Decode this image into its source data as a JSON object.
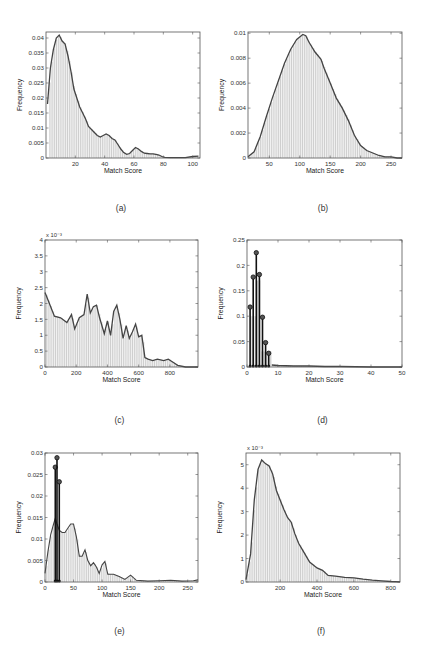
{
  "panels": [
    {
      "id": "a",
      "caption": "(a)",
      "frame": {
        "x": 46,
        "y": 32,
        "w": 154,
        "h": 126
      },
      "xlim": [
        0,
        105
      ],
      "ylim": [
        0,
        0.042
      ],
      "xticks": [
        20,
        40,
        60,
        80,
        100
      ],
      "yticks": [
        0,
        0.005,
        0.01,
        0.015,
        0.02,
        0.025,
        0.03,
        0.035,
        0.04
      ],
      "ytick_labels": [
        "0",
        "0.005",
        "0.01",
        "0.015",
        "0.02",
        "0.025",
        "0.03",
        "0.035",
        "0.04"
      ],
      "exponent": "",
      "xlabel": "Match Score",
      "ylabel": "Frequency",
      "stems": []
    },
    {
      "id": "b",
      "caption": "(b)",
      "frame": {
        "x": 248,
        "y": 32,
        "w": 154,
        "h": 126
      },
      "xlim": [
        15,
        268
      ],
      "ylim": [
        0,
        0.0101
      ],
      "xticks": [
        50,
        100,
        150,
        200,
        250
      ],
      "yticks": [
        0,
        0.002,
        0.004,
        0.006,
        0.008,
        0.01
      ],
      "ytick_labels": [
        "0",
        "0.002",
        "0.004",
        "0.006",
        "0.008",
        "0.01"
      ],
      "exponent": "",
      "xlabel": "Match Score",
      "ylabel": "Frequency",
      "stems": []
    },
    {
      "id": "c",
      "caption": "(c)",
      "frame": {
        "x": 45,
        "y": 240,
        "w": 153,
        "h": 127
      },
      "xlim": [
        0,
        980
      ],
      "ylim": [
        0,
        4
      ],
      "xticks": [
        0,
        200,
        400,
        600,
        800
      ],
      "yticks": [
        0,
        0.5,
        1,
        1.5,
        2,
        2.5,
        3,
        3.5,
        4
      ],
      "ytick_labels": [
        "0",
        "0.5",
        "1",
        "1.5",
        "2",
        "2.5",
        "3",
        "3.5",
        "4"
      ],
      "exponent": "x 10⁻³",
      "xlabel": "Match Score",
      "ylabel": "Frequency",
      "stems": []
    },
    {
      "id": "d",
      "caption": "(d)",
      "frame": {
        "x": 247,
        "y": 240,
        "w": 155,
        "h": 127
      },
      "xlim": [
        0,
        50
      ],
      "ylim": [
        0,
        0.25
      ],
      "xticks": [
        0,
        10,
        20,
        30,
        40,
        50
      ],
      "yticks": [
        0,
        0.05,
        0.1,
        0.15,
        0.2,
        0.25
      ],
      "ytick_labels": [
        "0",
        "0.05",
        "0.1",
        "0.15",
        "0.2",
        "0.25"
      ],
      "exponent": "",
      "xlabel": "Match Score",
      "ylabel": "Frequency",
      "stems": [
        [
          1,
          0.118
        ],
        [
          2,
          0.177
        ],
        [
          3,
          0.225
        ],
        [
          4,
          0.182
        ],
        [
          5,
          0.098
        ],
        [
          6,
          0.048
        ],
        [
          7,
          0.027
        ]
      ]
    },
    {
      "id": "e",
      "caption": "(e)",
      "frame": {
        "x": 45,
        "y": 453,
        "w": 153,
        "h": 129
      },
      "xlim": [
        0,
        268
      ],
      "ylim": [
        0,
        0.03
      ],
      "xticks": [
        0,
        50,
        100,
        150,
        200,
        250
      ],
      "yticks": [
        0,
        0.005,
        0.01,
        0.015,
        0.02,
        0.025,
        0.03
      ],
      "ytick_labels": [
        "0",
        "0.005",
        "0.01",
        "0.015",
        "0.02",
        "0.025",
        "0.03"
      ],
      "exponent": "",
      "xlabel": "Match Score",
      "ylabel": "Frequency",
      "stems": [
        [
          18,
          0.0267
        ],
        [
          21,
          0.0289
        ],
        [
          25,
          0.0233
        ]
      ]
    },
    {
      "id": "f",
      "caption": "(f)",
      "frame": {
        "x": 246,
        "y": 453,
        "w": 154,
        "h": 129
      },
      "xlim": [
        15,
        850
      ],
      "ylim": [
        0,
        5.5
      ],
      "xticks": [
        200,
        400,
        600,
        800
      ],
      "yticks": [
        0,
        1,
        2,
        3,
        4,
        5
      ],
      "ytick_labels": [
        "0",
        "1",
        "2",
        "3",
        "4",
        "5"
      ],
      "exponent": "x 10⁻³",
      "xlabel": "Match Score",
      "ylabel": "Frequency",
      "stems": []
    }
  ],
  "chart_data": [
    {
      "type": "bar",
      "title": "(a)",
      "xlabel": "Match Score",
      "ylabel": "Frequency",
      "xlim": [
        0,
        105
      ],
      "ylim": [
        0,
        0.042
      ],
      "x": [
        1,
        3,
        5,
        7,
        9,
        11,
        13,
        15,
        17,
        19,
        21,
        23,
        25,
        27,
        29,
        31,
        33,
        35,
        37,
        39,
        41,
        43,
        45,
        47,
        49,
        51,
        53,
        55,
        57,
        59,
        61,
        63,
        65,
        67,
        69,
        71,
        73,
        75,
        77,
        79,
        81,
        85,
        90,
        95,
        100,
        104
      ],
      "series": [
        {
          "name": "histogram",
          "values": [
            0.018,
            0.03,
            0.036,
            0.04,
            0.041,
            0.039,
            0.038,
            0.034,
            0.029,
            0.023,
            0.02,
            0.017,
            0.015,
            0.013,
            0.0105,
            0.0095,
            0.0085,
            0.0075,
            0.007,
            0.0075,
            0.008,
            0.0075,
            0.0065,
            0.006,
            0.0045,
            0.003,
            0.0018,
            0.0012,
            0.0015,
            0.0025,
            0.0035,
            0.003,
            0.0022,
            0.0016,
            0.0015,
            0.0014,
            0.0014,
            0.0012,
            0.001,
            0.0005,
            0.0002,
            0.0001,
            0.0001,
            0.0001,
            0.0005,
            0.0006
          ]
        },
        {
          "name": "density",
          "values": [
            0.018,
            0.03,
            0.036,
            0.04,
            0.041,
            0.039,
            0.038,
            0.034,
            0.029,
            0.023,
            0.02,
            0.017,
            0.015,
            0.013,
            0.0105,
            0.0095,
            0.0085,
            0.0075,
            0.007,
            0.0075,
            0.008,
            0.0075,
            0.0065,
            0.006,
            0.0045,
            0.003,
            0.0018,
            0.0012,
            0.0015,
            0.0025,
            0.0035,
            0.003,
            0.0022,
            0.0016,
            0.0015,
            0.0014,
            0.0014,
            0.0012,
            0.001,
            0.0005,
            0.0002,
            0.0001,
            0.0001,
            0.0001,
            0.0005,
            0.0006
          ]
        }
      ]
    },
    {
      "type": "bar",
      "title": "(b)",
      "xlabel": "Match Score",
      "ylabel": "Frequency",
      "xlim": [
        15,
        268
      ],
      "ylim": [
        0,
        0.0101
      ],
      "x": [
        15,
        25,
        35,
        45,
        55,
        65,
        75,
        85,
        95,
        105,
        110,
        115,
        125,
        135,
        140,
        150,
        160,
        170,
        180,
        190,
        200,
        210,
        220,
        230,
        240,
        250,
        260,
        268
      ],
      "series": [
        {
          "name": "histogram",
          "values": [
            0.0001,
            0.0005,
            0.0017,
            0.0033,
            0.0048,
            0.0062,
            0.0076,
            0.0087,
            0.0095,
            0.0099,
            0.0098,
            0.0093,
            0.0085,
            0.0079,
            0.0072,
            0.006,
            0.0048,
            0.004,
            0.003,
            0.0018,
            0.001,
            0.0006,
            0.0004,
            0.0002,
            0.0001,
            0.0001,
            0.0,
            0.0
          ]
        },
        {
          "name": "density",
          "values": [
            0.0001,
            0.0005,
            0.0017,
            0.0033,
            0.0048,
            0.0062,
            0.0076,
            0.0087,
            0.0095,
            0.0099,
            0.0098,
            0.0093,
            0.0085,
            0.0079,
            0.0072,
            0.006,
            0.0048,
            0.004,
            0.003,
            0.0018,
            0.001,
            0.0006,
            0.0004,
            0.0002,
            0.0001,
            0.0001,
            0.0,
            0.0
          ]
        }
      ]
    },
    {
      "type": "bar",
      "title": "(c)",
      "xlabel": "Match Score",
      "ylabel": "Frequency (x 10^-3)",
      "xlim": [
        0,
        980
      ],
      "ylim": [
        0,
        4
      ],
      "x": [
        0,
        20,
        60,
        100,
        140,
        170,
        190,
        220,
        250,
        270,
        290,
        310,
        330,
        350,
        380,
        400,
        420,
        440,
        460,
        480,
        500,
        520,
        540,
        560,
        580,
        600,
        620,
        640,
        660,
        690,
        720,
        760,
        790,
        820,
        850,
        900,
        980
      ],
      "series": [
        {
          "name": "histogram",
          "values": [
            2.35,
            2.1,
            1.6,
            1.55,
            1.4,
            1.65,
            1.2,
            1.55,
            1.65,
            2.3,
            1.7,
            1.9,
            1.95,
            1.55,
            1.05,
            1.45,
            1.0,
            1.75,
            1.95,
            1.5,
            0.9,
            1.3,
            0.9,
            1.1,
            1.35,
            0.95,
            1.0,
            0.3,
            0.25,
            0.2,
            0.25,
            0.2,
            0.25,
            0.15,
            0.05,
            0.0,
            0.0
          ]
        },
        {
          "name": "density",
          "values": [
            2.35,
            2.1,
            1.6,
            1.55,
            1.4,
            1.65,
            1.2,
            1.55,
            1.65,
            2.3,
            1.7,
            1.9,
            1.95,
            1.55,
            1.05,
            1.45,
            1.0,
            1.75,
            1.95,
            1.5,
            0.9,
            1.3,
            0.9,
            1.1,
            1.35,
            0.95,
            1.0,
            0.3,
            0.25,
            0.2,
            0.25,
            0.2,
            0.25,
            0.15,
            0.05,
            0.0,
            0.0
          ]
        }
      ]
    },
    {
      "type": "bar",
      "title": "(d)",
      "xlabel": "Match Score",
      "ylabel": "Frequency",
      "xlim": [
        0,
        50
      ],
      "ylim": [
        0,
        0.25
      ],
      "x": [
        1,
        2,
        3,
        4,
        5,
        6,
        7,
        8,
        10,
        15,
        20,
        25,
        30,
        35,
        40,
        45,
        50
      ],
      "series": [
        {
          "name": "histogram",
          "values": [
            0.1,
            0.1,
            0.17,
            0.17,
            0.03,
            0.03,
            0.03,
            0.004,
            0.003,
            0.002,
            0.002,
            0.001,
            0.001,
            0.0005,
            0.0,
            0.0,
            0.0
          ]
        },
        {
          "name": "stem",
          "values": [
            0.118,
            0.177,
            0.225,
            0.182,
            0.098,
            0.048,
            0.027,
            null,
            null,
            null,
            null,
            null,
            null,
            null,
            null,
            null,
            null
          ]
        }
      ]
    },
    {
      "type": "bar",
      "title": "(e)",
      "xlabel": "Match Score",
      "ylabel": "Frequency",
      "xlim": [
        0,
        268
      ],
      "ylim": [
        0,
        0.03
      ],
      "x": [
        0,
        5,
        10,
        15,
        18,
        21,
        25,
        30,
        35,
        40,
        45,
        50,
        55,
        60,
        65,
        70,
        75,
        80,
        85,
        90,
        95,
        100,
        105,
        110,
        120,
        130,
        140,
        150,
        160,
        180,
        200,
        220,
        240,
        260,
        268
      ],
      "series": [
        {
          "name": "histogram",
          "values": [
            0.002,
            0.007,
            0.011,
            0.0135,
            0.0148,
            0.0135,
            0.012,
            0.0115,
            0.0115,
            0.0125,
            0.0135,
            0.0135,
            0.0105,
            0.006,
            0.006,
            0.0075,
            0.005,
            0.0038,
            0.0045,
            0.0035,
            0.002,
            0.004,
            0.0048,
            0.0018,
            0.0018,
            0.0013,
            0.0006,
            0.0016,
            0.0004,
            0.0002,
            0.0003,
            0.0004,
            0.0002,
            0.0003,
            0.0005
          ]
        },
        {
          "name": "stem",
          "values": [
            null,
            null,
            null,
            null,
            0.0267,
            0.0289,
            0.0233,
            null,
            null,
            null,
            null,
            null,
            null,
            null,
            null,
            null,
            null,
            null,
            null,
            null,
            null,
            null,
            null,
            null,
            null,
            null,
            null,
            null,
            null,
            null,
            null,
            null,
            null,
            null,
            null
          ]
        }
      ]
    },
    {
      "type": "bar",
      "title": "(f)",
      "xlabel": "Match Score",
      "ylabel": "Frequency (x 10^-3)",
      "xlim": [
        15,
        850
      ],
      "ylim": [
        0,
        5.5
      ],
      "x": [
        15,
        40,
        60,
        80,
        100,
        120,
        140,
        160,
        180,
        200,
        220,
        240,
        260,
        280,
        300,
        330,
        360,
        400,
        430,
        460,
        500,
        550,
        600,
        650,
        700,
        750,
        800,
        850
      ],
      "series": [
        {
          "name": "histogram",
          "values": [
            0.1,
            1.2,
            3.5,
            4.8,
            5.2,
            5.05,
            4.95,
            4.6,
            3.9,
            3.5,
            3.1,
            2.75,
            2.55,
            2.05,
            1.65,
            1.25,
            0.85,
            0.6,
            0.5,
            0.28,
            0.25,
            0.2,
            0.18,
            0.12,
            0.08,
            0.05,
            0.02,
            0.01
          ]
        },
        {
          "name": "density",
          "values": [
            0.1,
            1.2,
            3.5,
            4.8,
            5.2,
            5.05,
            4.95,
            4.6,
            3.9,
            3.5,
            3.1,
            2.75,
            2.55,
            2.05,
            1.65,
            1.25,
            0.85,
            0.6,
            0.5,
            0.28,
            0.25,
            0.2,
            0.18,
            0.12,
            0.08,
            0.05,
            0.02,
            0.01
          ]
        }
      ]
    }
  ]
}
